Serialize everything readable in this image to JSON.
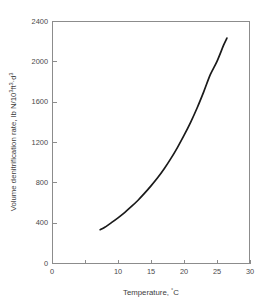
{
  "chart_data": {
    "type": "line",
    "title": "",
    "subtitle": "",
    "xlabel": "Temperature, °C",
    "ylabel": "Volume denitrification rate, lb N/10³ft³·d³",
    "ylabel_parts": {
      "base1": "Volume denitrification rate, lb N/10",
      "sup1": "3",
      "base2": "ft",
      "sup2": "3",
      "base3": "·d",
      "sup3": "3"
    },
    "xlabel_parts": {
      "base": "Temperature, ",
      "degree": "°",
      "unit": "C"
    },
    "xlim": [
      0,
      30
    ],
    "ylim": [
      0,
      2400
    ],
    "xticks": [
      0,
      5,
      10,
      15,
      20,
      25,
      30
    ],
    "xtick_labels": [
      "0",
      "",
      "10",
      "15",
      "20",
      "25",
      "30"
    ],
    "yticks": [
      0,
      400,
      800,
      1200,
      1600,
      2000,
      2400
    ],
    "ytick_labels": [
      "0",
      "400",
      "800",
      "1200",
      "1600",
      "2000",
      "2400"
    ],
    "grid": false,
    "legend": false,
    "legend_position": "none",
    "series": [
      {
        "name": "Volume denitrification rate",
        "color": "#1a1a1a",
        "x": [
          7.3,
          8.0,
          9.0,
          10.0,
          11.0,
          12.0,
          13.0,
          14.0,
          15.0,
          16.0,
          17.0,
          18.0,
          19.0,
          20.0,
          21.0,
          22.0,
          23.0,
          24.0,
          25.0,
          26.0,
          26.5
        ],
        "y": [
          330,
          355,
          400,
          448,
          500,
          558,
          620,
          690,
          765,
          845,
          935,
          1035,
          1145,
          1265,
          1395,
          1540,
          1700,
          1870,
          2000,
          2160,
          2230
        ]
      }
    ],
    "annotations": [],
    "colors": {
      "curve": "#1a1a1a",
      "axis": "#8c8c8c",
      "text": "#4a4a4a",
      "background": "#ffffff"
    }
  },
  "figure": {
    "plot_area": {
      "left": 52,
      "right": 250,
      "top": 21,
      "bottom": 263
    }
  }
}
